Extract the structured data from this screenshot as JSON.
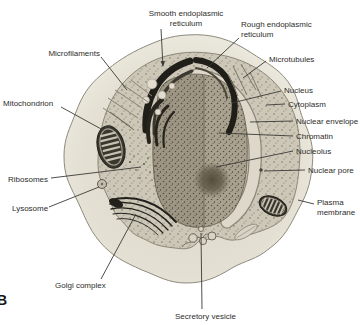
{
  "panel": {
    "letter": "B"
  },
  "colors": {
    "background": "#ffffff",
    "cell_fill": "#e6e2d5",
    "cytoplasm_fill": "#cdc7b8",
    "nucleus_fill": "#aaa290",
    "nucleolus_fill": "#564f3e",
    "membrane_dark": "#1f1e19",
    "leader_line": "#3a3a38",
    "label_text": "#2e2d2b"
  },
  "labels": [
    {
      "id": "smooth-er",
      "lines": [
        "Smooth endoplasmic",
        "reticulum"
      ],
      "align": "center",
      "x": 186,
      "y": 9,
      "leader": [
        161,
        29,
        163,
        66
      ],
      "arrow": true
    },
    {
      "id": "rough-er",
      "lines": [
        "Rough endoplasmic",
        "reticulum"
      ],
      "align": "left",
      "x": 241,
      "y": 20,
      "leader": [
        239,
        38,
        207,
        68
      ],
      "arrow": false
    },
    {
      "id": "microtubules",
      "lines": [
        "Microtubules"
      ],
      "align": "left",
      "x": 269,
      "y": 55,
      "leader": [
        266,
        61,
        243,
        78
      ],
      "arrow": false
    },
    {
      "id": "nucleus",
      "lines": [
        "Nucleus"
      ],
      "align": "left",
      "x": 284,
      "y": 86,
      "leader": [
        281,
        91,
        232,
        103
      ],
      "arrow": false
    },
    {
      "id": "cytoplasm",
      "lines": [
        "Cytoplasm"
      ],
      "align": "left",
      "x": 288,
      "y": 100,
      "leader": [
        285,
        104,
        266,
        105
      ],
      "arrow": false
    },
    {
      "id": "nuclear-envelope",
      "lines": [
        "Nuclear envelope"
      ],
      "align": "left",
      "x": 296,
      "y": 117,
      "leader": [
        293,
        121,
        250,
        122
      ],
      "arrow": false
    },
    {
      "id": "chromatin",
      "lines": [
        "Chromatin"
      ],
      "align": "left",
      "x": 296,
      "y": 132,
      "leader": [
        293,
        136,
        219,
        133
      ],
      "arrow": false
    },
    {
      "id": "nucleolus",
      "lines": [
        "Nucleolus"
      ],
      "align": "left",
      "x": 296,
      "y": 147,
      "leader": [
        293,
        151,
        216,
        167
      ],
      "arrow": false
    },
    {
      "id": "nuclear-pore",
      "lines": [
        "Nuclear pore"
      ],
      "align": "left",
      "x": 308,
      "y": 166,
      "leader": [
        305,
        170,
        264,
        171
      ],
      "arrow": false
    },
    {
      "id": "plasma-membrane",
      "lines": [
        "Plasma",
        "membrane"
      ],
      "align": "left",
      "x": 317,
      "y": 198,
      "leader": [
        314,
        204,
        298,
        200
      ],
      "arrow": false
    },
    {
      "id": "microfilaments",
      "lines": [
        "Microfilaments"
      ],
      "align": "right",
      "x": 100,
      "y": 49,
      "leader": [
        101,
        57,
        127,
        90
      ],
      "arrow": false
    },
    {
      "id": "mitochondrion",
      "lines": [
        "Mitochondrion"
      ],
      "align": "left",
      "x": 3,
      "y": 99,
      "leader": [
        61,
        107,
        103,
        130
      ],
      "arrow": false
    },
    {
      "id": "ribosomes",
      "lines": [
        "Ribosomes"
      ],
      "align": "left",
      "x": 8,
      "y": 175,
      "leader": [
        51,
        178,
        141,
        167
      ],
      "arrow": false
    },
    {
      "id": "lysosome",
      "lines": [
        "Lysosome"
      ],
      "align": "left",
      "x": 12,
      "y": 204,
      "leader": [
        49,
        207,
        99,
        187
      ],
      "arrow": false
    },
    {
      "id": "golgi-complex",
      "lines": [
        "Golgi complex"
      ],
      "align": "left",
      "x": 55,
      "y": 281,
      "leader": [
        101,
        279,
        136,
        214
      ],
      "arrow": false
    },
    {
      "id": "secretory-vesicle",
      "lines": [
        "Secretory vesicle"
      ],
      "align": "left",
      "x": 175,
      "y": 312,
      "leader": [
        202,
        309,
        201,
        233
      ],
      "arrow": false
    }
  ]
}
